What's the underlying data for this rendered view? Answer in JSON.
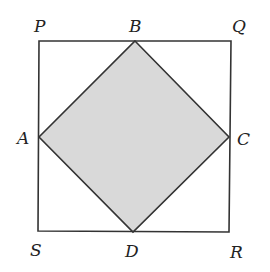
{
  "diagram": {
    "outer_square": {
      "vertices": [
        {
          "name": "P",
          "x": 39,
          "y": 41
        },
        {
          "name": "Q",
          "x": 231,
          "y": 41
        },
        {
          "name": "R",
          "x": 229,
          "y": 232
        },
        {
          "name": "S",
          "x": 38,
          "y": 231
        }
      ]
    },
    "inner_square": {
      "fill": "#d9d9d9",
      "vertices": [
        {
          "name": "B",
          "x": 135,
          "y": 41
        },
        {
          "name": "C",
          "x": 229,
          "y": 137
        },
        {
          "name": "D",
          "x": 133,
          "y": 232
        },
        {
          "name": "A",
          "x": 39,
          "y": 137
        }
      ]
    },
    "labels": {
      "P": "P",
      "Q": "Q",
      "R": "R",
      "S": "S",
      "A": "A",
      "B": "B",
      "C": "C",
      "D": "D"
    },
    "stroke_color": "#333333"
  }
}
